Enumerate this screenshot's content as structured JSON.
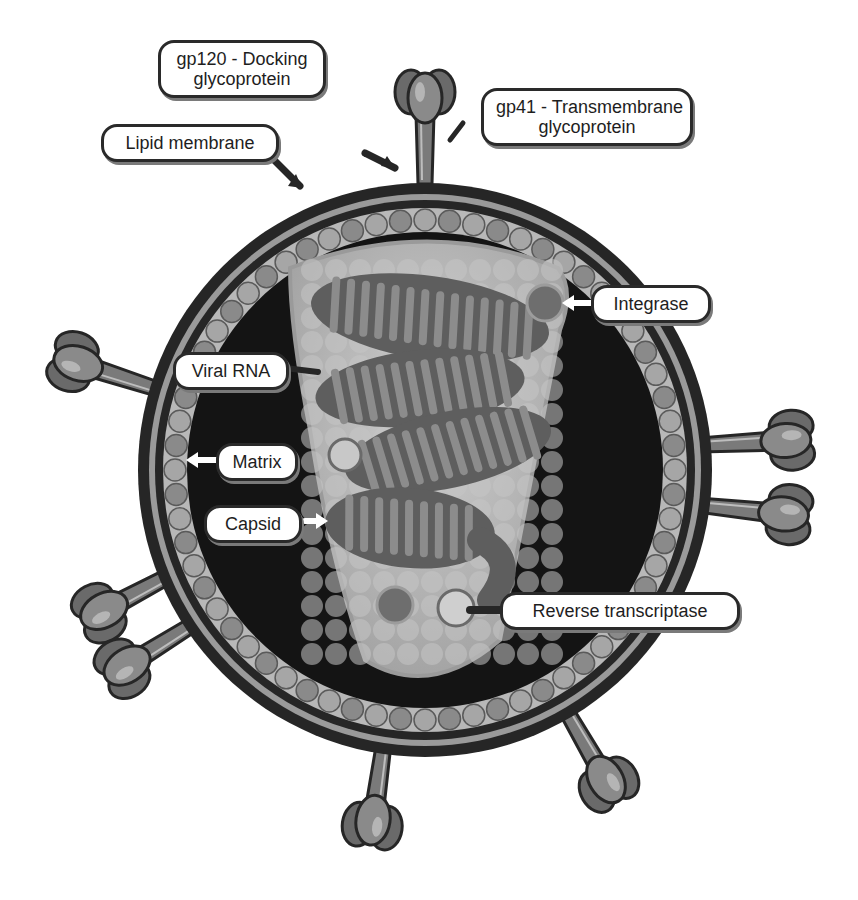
{
  "diagram": {
    "labels": {
      "gp120": {
        "line1": "gp120 - Docking",
        "line2": "glycoprotein"
      },
      "gp41": {
        "line1": "gp41 - Transmembrane",
        "line2": "glycoprotein"
      },
      "lipid_membrane": "Lipid membrane",
      "integrase": "Integrase",
      "viral_rna": "Viral RNA",
      "matrix": "Matrix",
      "capsid": "Capsid",
      "reverse_transcriptase": "Reverse transcriptase"
    },
    "colors": {
      "background": "#ffffff",
      "outline": "#2a2a2a",
      "membrane_dark": "#262626",
      "membrane_light": "#9a9a9a",
      "matrix_band": "#b8b8b8",
      "interior": "#141414",
      "capsid_fill": "#b4b4b4",
      "rna": "#5e5e5e",
      "rna_rungs": "#8c8c8c",
      "spike": "#707070",
      "label_fill": "#ffffff"
    }
  }
}
